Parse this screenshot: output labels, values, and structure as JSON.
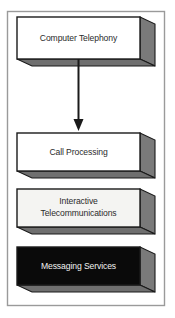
{
  "diagram": {
    "frame": {
      "border_color": "#9a9a9a",
      "background_color": "#ffffff",
      "x": 7,
      "y": 11,
      "width": 158,
      "height": 295
    },
    "palette": {
      "box_face_white": "#ffffff",
      "box_face_light": "#f4f4f2",
      "box_face_black": "#0a0a0a",
      "box_side_gray": "#7a7a7a",
      "box_bottom_gray": "#6f6f6f",
      "box_outline": "#1a1a1a",
      "text_dark": "#2b2b2b",
      "text_light": "#f2f2f2",
      "arrow_color": "#1a1a1a"
    },
    "nodes": [
      {
        "id": "computer-telephony",
        "lines": [
          "Computer Telephony"
        ],
        "face_color": "#ffffff",
        "text_color": "#2b2b2b",
        "x": 17,
        "y": 17,
        "width": 123,
        "height": 42,
        "depth": 15
      },
      {
        "id": "call-processing",
        "lines": [
          "Call Processing"
        ],
        "face_color": "#ffffff",
        "text_color": "#2b2b2b",
        "x": 17,
        "y": 133,
        "width": 123,
        "height": 38,
        "depth": 15
      },
      {
        "id": "interactive-telecommunications",
        "lines": [
          "Interactive",
          "Telecommunications"
        ],
        "face_color": "#f4f4f2",
        "text_color": "#2b2b2b",
        "x": 17,
        "y": 189,
        "width": 123,
        "height": 38,
        "depth": 15
      },
      {
        "id": "messaging-services",
        "lines": [
          "Messaging Services"
        ],
        "face_color": "#0a0a0a",
        "text_color": "#f2f2f2",
        "x": 17,
        "y": 247,
        "width": 123,
        "height": 38,
        "depth": 15
      }
    ],
    "connectors": [
      {
        "id": "arrow-telephony-to-call-processing",
        "from": "computer-telephony",
        "to": "call-processing",
        "x": 78.5,
        "y_start": 59,
        "y_end": 131,
        "head_width": 10,
        "head_height": 11,
        "line_width": 2
      }
    ],
    "labels": {
      "node_0_line_0": "Computer Telephony",
      "node_1_line_0": "Call Processing",
      "node_2_line_0": "Interactive",
      "node_2_line_1": "Telecommunications",
      "node_3_line_0": "Messaging Services"
    }
  }
}
